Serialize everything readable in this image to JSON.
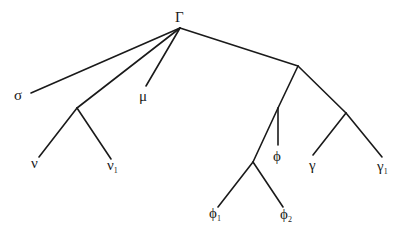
{
  "diagram": {
    "type": "tree",
    "nodes": [
      {
        "id": "root",
        "label": "Γ",
        "sub": "",
        "x": 180,
        "y": 28,
        "label_x": 175,
        "label_y": 22
      },
      {
        "id": "sigma",
        "label": "σ",
        "sub": "",
        "x": 31,
        "y": 93,
        "label_x": 14,
        "label_y": 100
      },
      {
        "id": "nu_parent",
        "label": "",
        "sub": "",
        "x": 77,
        "y": 108
      },
      {
        "id": "mu",
        "label": "μ",
        "sub": "",
        "x": 146,
        "y": 86,
        "label_x": 139,
        "label_y": 101
      },
      {
        "id": "nu",
        "label": "ν",
        "sub": "",
        "x": 39,
        "y": 157,
        "label_x": 31,
        "label_y": 168
      },
      {
        "id": "nu1",
        "label": "ν",
        "sub": "1",
        "x": 111,
        "y": 159,
        "label_x": 107,
        "label_y": 170
      },
      {
        "id": "right",
        "label": "",
        "sub": "",
        "x": 298,
        "y": 66
      },
      {
        "id": "phi_branch",
        "label": "",
        "sub": "",
        "x": 278,
        "y": 108
      },
      {
        "id": "phi",
        "label": "ϕ",
        "sub": "",
        "x": 278,
        "y": 145,
        "label_x": 273,
        "label_y": 161
      },
      {
        "id": "phi_parent",
        "label": "",
        "sub": "",
        "x": 253,
        "y": 162
      },
      {
        "id": "phi1",
        "label": "ϕ",
        "sub": "1",
        "x": 218,
        "y": 207,
        "label_x": 209,
        "label_y": 218
      },
      {
        "id": "phi2",
        "label": "ϕ",
        "sub": "2",
        "x": 283,
        "y": 207,
        "label_x": 280,
        "label_y": 219
      },
      {
        "id": "gamma_parent",
        "label": "",
        "sub": "",
        "x": 346,
        "y": 113
      },
      {
        "id": "gamma",
        "label": "γ",
        "sub": "",
        "x": 313,
        "y": 155,
        "label_x": 309,
        "label_y": 170
      },
      {
        "id": "gamma1",
        "label": "γ",
        "sub": "1",
        "x": 382,
        "y": 157,
        "label_x": 377,
        "label_y": 171
      }
    ],
    "edges": [
      {
        "from": "root",
        "to": "sigma"
      },
      {
        "from": "root",
        "to": "nu_parent"
      },
      {
        "from": "root",
        "to": "mu"
      },
      {
        "from": "root",
        "to": "right"
      },
      {
        "from": "nu_parent",
        "to": "nu"
      },
      {
        "from": "nu_parent",
        "to": "nu1"
      },
      {
        "from": "right",
        "to": "phi_branch"
      },
      {
        "from": "right",
        "to": "gamma_parent"
      },
      {
        "from": "phi_branch",
        "to": "phi"
      },
      {
        "from": "phi_branch",
        "to": "phi_parent"
      },
      {
        "from": "phi_parent",
        "to": "phi1"
      },
      {
        "from": "phi_parent",
        "to": "phi2"
      },
      {
        "from": "gamma_parent",
        "to": "gamma"
      },
      {
        "from": "gamma_parent",
        "to": "gamma1"
      }
    ],
    "colors": {
      "line": "#1a1a1a",
      "text": "#1a1a1a",
      "background": "#ffffff"
    }
  }
}
